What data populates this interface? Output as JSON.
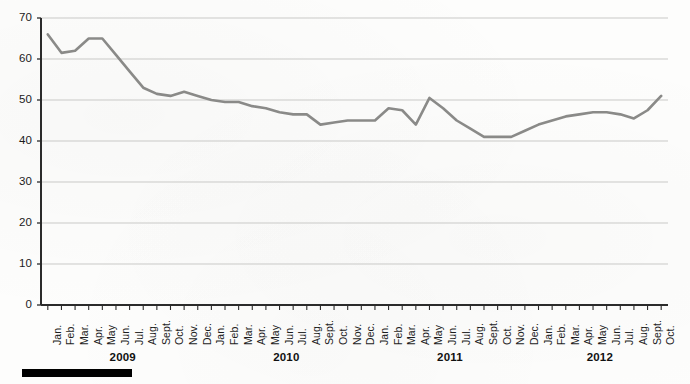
{
  "chart_data": {
    "type": "line",
    "title": "",
    "subtitle": "",
    "xlabel": "",
    "ylabel": "",
    "ylim": [
      0,
      70
    ],
    "ytick_step": 10,
    "yticks": [
      "0",
      "10",
      "20",
      "30",
      "40",
      "50",
      "60",
      "70"
    ],
    "grid": true,
    "legend": null,
    "line_color": "#8a8a88",
    "axis_color": "#2b2b2b",
    "grid_color": "#c9c9c7",
    "x": [
      "Jan.",
      "Feb.",
      "Mar.",
      "Apr.",
      "May",
      "Jun.",
      "Jul.",
      "Aug.",
      "Sept.",
      "Oct.",
      "Nov.",
      "Dec.",
      "Jan.",
      "Feb.",
      "Mar.",
      "Apr.",
      "May",
      "Jun.",
      "Jul.",
      "Aug.",
      "Sept.",
      "Oct.",
      "Nov.",
      "Dec.",
      "Jan.",
      "Feb.",
      "Mar.",
      "Apr.",
      "May",
      "Jun.",
      "Jul.",
      "Aug.",
      "Sept.",
      "Oct.",
      "Nov.",
      "Dec.",
      "Jan.",
      "Feb.",
      "Mar.",
      "Apr.",
      "May",
      "Jun.",
      "Jul.",
      "Aug.",
      "Sept.",
      "Oct."
    ],
    "values": [
      66,
      61.5,
      62,
      65,
      65,
      61,
      57,
      53,
      51.5,
      51,
      52,
      51,
      50,
      49.5,
      49.5,
      48.5,
      48,
      47,
      46.5,
      46.5,
      44,
      44.5,
      45,
      45,
      45,
      48,
      47.5,
      44,
      50.5,
      48,
      45,
      43,
      41,
      41,
      41,
      42.5,
      44,
      45,
      46,
      46.5,
      47,
      47,
      46.5,
      45.5,
      47.5,
      51
    ],
    "year_groups": [
      {
        "label": "2009",
        "start_index": 0,
        "end_index": 11
      },
      {
        "label": "2010",
        "start_index": 12,
        "end_index": 23
      },
      {
        "label": "2011",
        "start_index": 24,
        "end_index": 35
      },
      {
        "label": "2012",
        "start_index": 36,
        "end_index": 45
      }
    ]
  }
}
